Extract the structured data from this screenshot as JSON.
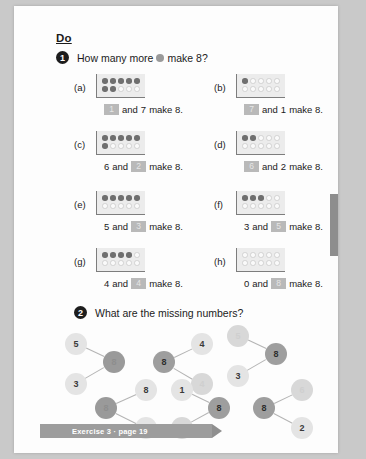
{
  "page": {
    "heading": "Do",
    "edge_tab": "page-edge-tab"
  },
  "question1": {
    "number": "1",
    "text_before": "How many more",
    "text_after": "make 8?",
    "icon": "filled-dot-icon",
    "parts": [
      {
        "label": "(a)",
        "frame": {
          "row1": [
            1,
            1,
            1,
            1,
            1
          ],
          "row2": [
            1,
            1,
            0,
            0,
            0
          ]
        },
        "sentence": {
          "first": "",
          "first_blank": true,
          "first_value": "1",
          "middle": "and",
          "second": "7",
          "second_blank": false,
          "tail": "make 8."
        }
      },
      {
        "label": "(b)",
        "frame": {
          "row1": [
            1,
            0,
            0,
            0,
            0
          ],
          "row2": [
            0,
            0,
            0,
            0,
            0
          ]
        },
        "sentence": {
          "first": "",
          "first_blank": true,
          "first_value": "7",
          "middle": "and",
          "second": "1",
          "second_blank": false,
          "tail": "make 8."
        }
      },
      {
        "label": "(c)",
        "frame": {
          "row1": [
            1,
            1,
            1,
            1,
            1
          ],
          "row2": [
            1,
            0,
            0,
            0,
            0
          ]
        },
        "sentence": {
          "first": "6",
          "first_blank": false,
          "middle": "and",
          "second": "2",
          "second_blank": true,
          "tail": "make 8."
        }
      },
      {
        "label": "(d)",
        "frame": {
          "row1": [
            1,
            1,
            0,
            0,
            0
          ],
          "row2": [
            0,
            0,
            0,
            0,
            0
          ]
        },
        "sentence": {
          "first": "",
          "first_blank": true,
          "first_value": "6",
          "middle": "and",
          "second": "2",
          "second_blank": false,
          "tail": "make 8."
        }
      },
      {
        "label": "(e)",
        "frame": {
          "row1": [
            1,
            1,
            1,
            1,
            1
          ],
          "row2": [
            0,
            0,
            0,
            0,
            0
          ]
        },
        "sentence": {
          "first": "5",
          "first_blank": false,
          "middle": "and",
          "second": "3",
          "second_blank": true,
          "tail": "make 8."
        }
      },
      {
        "label": "(f)",
        "frame": {
          "row1": [
            1,
            1,
            1,
            0,
            0
          ],
          "row2": [
            0,
            0,
            0,
            0,
            0
          ]
        },
        "sentence": {
          "first": "3",
          "first_blank": false,
          "middle": "and",
          "second": "5",
          "second_blank": true,
          "tail": "make 8."
        }
      },
      {
        "label": "(g)",
        "frame": {
          "row1": [
            1,
            1,
            1,
            1,
            0
          ],
          "row2": [
            0,
            0,
            0,
            0,
            0
          ]
        },
        "sentence": {
          "first": "4",
          "first_blank": false,
          "middle": "and",
          "second": "4",
          "second_blank": true,
          "tail": "make 8."
        }
      },
      {
        "label": "(h)",
        "frame": {
          "row1": [
            0,
            0,
            0,
            0,
            0
          ],
          "row2": [
            0,
            0,
            0,
            0,
            0
          ]
        },
        "sentence": {
          "first": "0",
          "first_blank": false,
          "middle": "and",
          "second": "8",
          "second_blank": true,
          "tail": "make 8."
        }
      }
    ]
  },
  "question2": {
    "number": "2",
    "text": "What are the missing numbers?",
    "bonds": [
      {
        "id": "bond-1",
        "part1": "5",
        "part1_state": "given",
        "part2": "3",
        "part2_state": "given",
        "whole": "8",
        "whole_state": "answer-dark"
      },
      {
        "id": "bond-2",
        "part1": "8",
        "part1_state": "given",
        "part2": "0",
        "part2_state": "given",
        "whole": "8",
        "whole_state": "answer-dark"
      },
      {
        "id": "bond-3",
        "part1": "4",
        "part1_state": "given",
        "part2": "4",
        "part2_state": "answer",
        "whole": "8",
        "whole_state": "whole"
      },
      {
        "id": "bond-4",
        "part1": "1",
        "part1_state": "given",
        "part2": "7",
        "part2_state": "answer",
        "whole": "8",
        "whole_state": "whole"
      },
      {
        "id": "bond-5",
        "part1": "5",
        "part1_state": "answer",
        "part2": "3",
        "part2_state": "given",
        "whole": "8",
        "whole_state": "whole"
      },
      {
        "id": "bond-6",
        "part1": "6",
        "part1_state": "answer",
        "part2": "2",
        "part2_state": "given",
        "whole": "8",
        "whole_state": "whole"
      }
    ]
  },
  "footer": {
    "text": "Exercise 3 · page 19"
  }
}
